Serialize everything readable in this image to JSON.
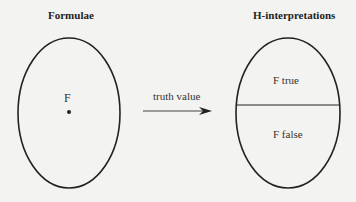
{
  "left": {
    "title": "Formulae",
    "point_label": "F"
  },
  "right": {
    "title": "H-interpretations",
    "top_region": "F true",
    "bottom_region": "F false"
  },
  "arrow": {
    "label": "truth value"
  }
}
